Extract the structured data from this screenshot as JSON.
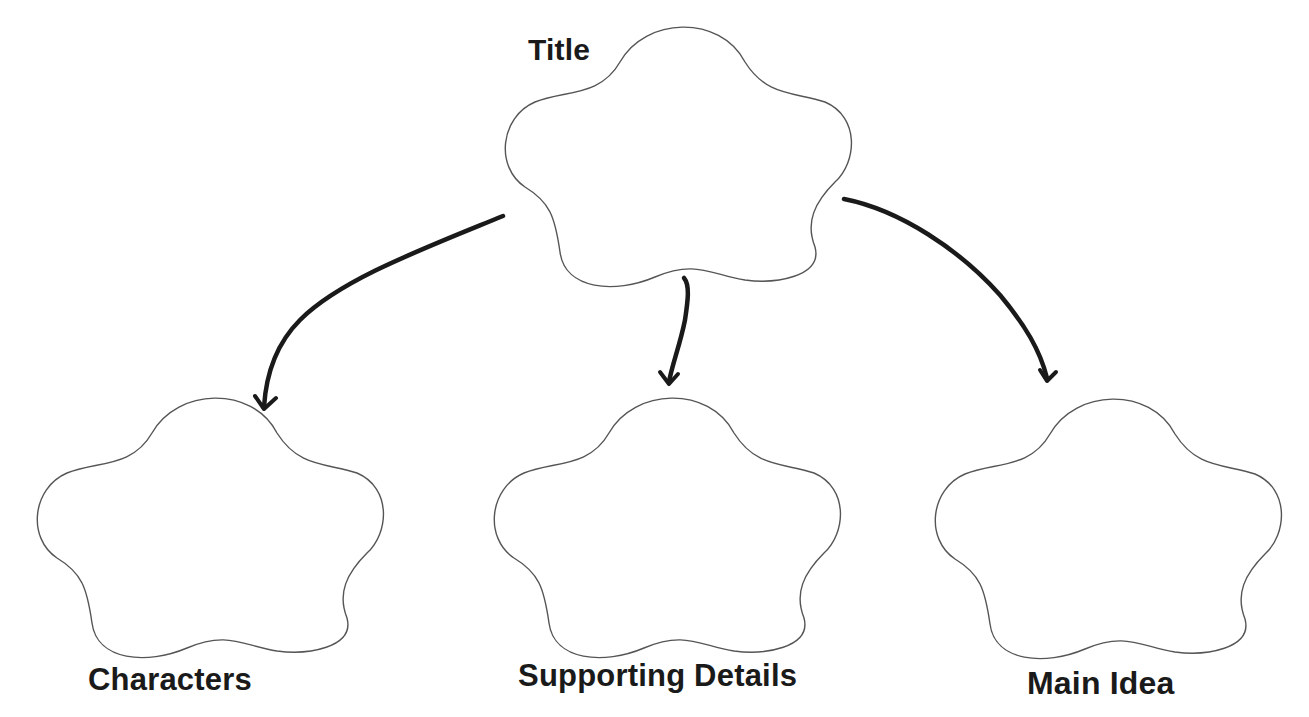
{
  "diagram": {
    "type": "graphic-organizer",
    "nodes": [
      {
        "id": "title",
        "label": "Title"
      },
      {
        "id": "characters",
        "label": "Characters"
      },
      {
        "id": "supporting-details",
        "label": "Supporting Details"
      },
      {
        "id": "main-idea",
        "label": "Main Idea"
      }
    ],
    "edges": [
      {
        "from": "title",
        "to": "characters"
      },
      {
        "from": "title",
        "to": "supporting-details"
      },
      {
        "from": "title",
        "to": "main-idea"
      }
    ],
    "colors": {
      "outline": "#555555",
      "arrow": "#1a1a1a",
      "text": "#1a1a1a",
      "background": "#ffffff"
    }
  }
}
